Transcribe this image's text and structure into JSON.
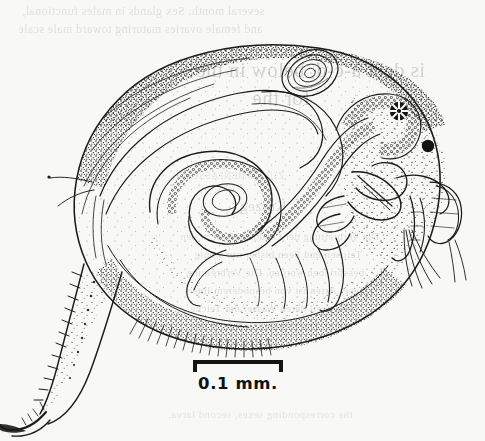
{
  "page": {
    "kind": "scanned-book-plate",
    "background_color": "#f8f8f6",
    "ink_color": "#1b1b1b",
    "width": 485,
    "height": 441
  },
  "figure": {
    "name": "cladoceran-lateral-view",
    "caption_present": false,
    "parts": [
      {
        "id": "carapace",
        "label": "carapace"
      },
      {
        "id": "brood-chamber",
        "label": "brood chamber"
      },
      {
        "id": "embryo-ovoid",
        "label": "embryo"
      },
      {
        "id": "gut-coil",
        "label": "coiled gut"
      },
      {
        "id": "gut-granular",
        "label": "granular gut contents"
      },
      {
        "id": "compound-eye",
        "label": "compound eye"
      },
      {
        "id": "ocellus",
        "label": "ocellus"
      },
      {
        "id": "rostrum",
        "label": "rostrum"
      },
      {
        "id": "antennule",
        "label": "antennule"
      },
      {
        "id": "antenna",
        "label": "swimming antenna"
      },
      {
        "id": "antennal-setae",
        "label": "antennal setae"
      },
      {
        "id": "thoracic-limbs",
        "label": "thoracic limbs"
      },
      {
        "id": "ventral-setae",
        "label": "ventral setae fringe"
      },
      {
        "id": "postabdomen",
        "label": "postabdomen"
      },
      {
        "id": "abdominal-claw",
        "label": "abdominal claw"
      },
      {
        "id": "anal-spines",
        "label": "anal spines"
      }
    ]
  },
  "scale_bar": {
    "label": "0.1 mm.",
    "value": 0.1,
    "unit": "mm",
    "bar_length_px": 90,
    "style": "bracket"
  },
  "bleed_through": {
    "note": "Faint mirrored show-through of text printed on the reverse of the leaf; only partially legible.",
    "lines": [
      {
        "text": "several month. Sex glands in males functional,",
        "x": 22,
        "y": 4,
        "size": 12,
        "opacity": 0.1
      },
      {
        "text": "and female ovaries maturing toward male scale",
        "x": 18,
        "y": 22,
        "size": 12,
        "opacity": 0.1
      },
      {
        "text": "is debt a-c-d, below in the",
        "x": 196,
        "y": 58,
        "size": 21,
        "opacity": 0.15
      },
      {
        "text": "for the",
        "x": 252,
        "y": 86,
        "size": 21,
        "opacity": 0.15
      },
      {
        "text": "ZUSAMMENFASSUNG",
        "x": 176,
        "y": 170,
        "size": 10,
        "opacity": 0.09
      },
      {
        "text": "Kurzeg",
        "x": 240,
        "y": 198,
        "size": 15,
        "opacity": 0.11
      },
      {
        "text": "Die Verbreitung der Cladoceren ist in den",
        "x": 180,
        "y": 230,
        "size": 11,
        "opacity": 0.1
      },
      {
        "text": "Teichen und Seen bisher nur wenig",
        "x": 194,
        "y": 248,
        "size": 11,
        "opacity": 0.1
      },
      {
        "text": "beschrieben worden. Die Verbreitung",
        "x": 186,
        "y": 266,
        "size": 11,
        "opacity": 0.1
      },
      {
        "text": "dieser Arten ist von besonderem Inter-",
        "x": 184,
        "y": 284,
        "size": 11,
        "opacity": 0.1
      },
      {
        "text": "esse, weil deren Wasser der Teiche",
        "x": 190,
        "y": 302,
        "size": 11,
        "opacity": 0.1
      },
      {
        "text": "bleibt. Die Ergebnisse sind in der",
        "x": 192,
        "y": 320,
        "size": 11,
        "opacity": 0.1
      },
      {
        "text": "the corresponding sexes, second larva.",
        "x": 168,
        "y": 408,
        "size": 11,
        "opacity": 0.09
      }
    ]
  }
}
